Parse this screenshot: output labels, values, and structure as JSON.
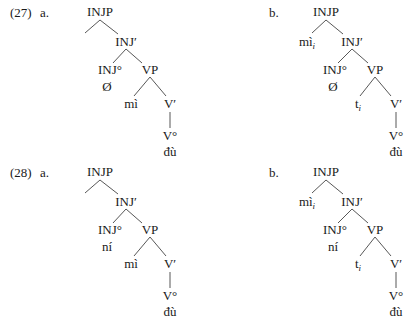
{
  "examples": [
    {
      "number": "(27)",
      "trees": [
        {
          "letter": "a.",
          "INJP": "INJP",
          "spec": "",
          "INJbar": "INJ′",
          "INJhead": "INJ°",
          "INJword": "Ø",
          "VP": "VP",
          "vp_spec": "mì",
          "vp_spec_sub": "",
          "Vbar": "V′",
          "Vhead": "V°",
          "Vword": "đù"
        },
        {
          "letter": "b.",
          "INJP": "INJP",
          "spec": "mì",
          "spec_sub": "i",
          "INJbar": "INJ′",
          "INJhead": "INJ°",
          "INJword": "Ø",
          "VP": "VP",
          "vp_spec": "t",
          "vp_spec_sub": "i",
          "Vbar": "V′",
          "Vhead": "V°",
          "Vword": "đù"
        }
      ]
    },
    {
      "number": "(28)",
      "trees": [
        {
          "letter": "a.",
          "INJP": "INJP",
          "spec": "",
          "INJbar": "INJ′",
          "INJhead": "INJ°",
          "INJword": "ní",
          "VP": "VP",
          "vp_spec": "mì",
          "vp_spec_sub": "",
          "Vbar": "V′",
          "Vhead": "V°",
          "Vword": "đù"
        },
        {
          "letter": "b.",
          "INJP": "INJP",
          "spec": "mì",
          "spec_sub": "i",
          "INJbar": "INJ′",
          "INJhead": "INJ°",
          "INJword": "ní",
          "VP": "VP",
          "vp_spec": "t",
          "vp_spec_sub": "i",
          "Vbar": "V′",
          "Vhead": "V°",
          "Vword": "đù"
        }
      ]
    }
  ]
}
